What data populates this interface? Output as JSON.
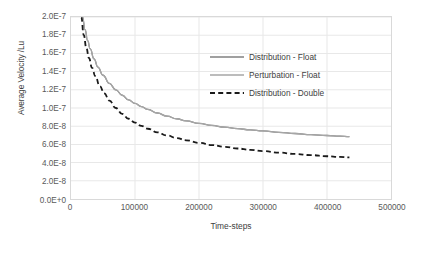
{
  "chart_data": {
    "type": "line",
    "title": "",
    "xlabel": "Time-steps",
    "ylabel": "Average Velocity /Lu",
    "xlim": [
      0,
      500000
    ],
    "ylim": [
      0,
      2e-07
    ],
    "grid": true,
    "legend_position": "inside-upper-right",
    "x_ticks": [
      0,
      100000,
      200000,
      300000,
      400000,
      500000
    ],
    "x_tick_labels": [
      "0",
      "100000",
      "200000",
      "300000",
      "400000",
      "500000"
    ],
    "y_ticks": [
      0,
      2e-08,
      4e-08,
      6e-08,
      8e-08,
      1e-07,
      1.2e-07,
      1.4e-07,
      1.6e-07,
      1.8e-07,
      2e-07
    ],
    "y_tick_labels": [
      "0.0E+0",
      "2.0E-8",
      "4.0E-8",
      "6.0E-8",
      "8.0E-8",
      "1.0E-7",
      "1.2E-7",
      "1.4E-7",
      "1.6E-7",
      "1.8E-7",
      "2.0E-7"
    ],
    "series": [
      {
        "name": "Distribution - Float",
        "style": "solid",
        "color": "#808080",
        "width": 1.3,
        "x": [
          18000,
          22000,
          26000,
          30000,
          36000,
          42000,
          50000,
          60000,
          70000,
          80000,
          90000,
          100000,
          110000,
          120000,
          135000,
          150000,
          165000,
          180000,
          200000,
          220000,
          240000,
          260000,
          280000,
          300000,
          325000,
          350000,
          375000,
          400000,
          420000,
          435000
        ],
        "y": [
          2e-07,
          1.86e-07,
          1.74e-07,
          1.65e-07,
          1.54e-07,
          1.45e-07,
          1.36e-07,
          1.27e-07,
          1.2e-07,
          1.14e-07,
          1.09e-07,
          1.05e-07,
          1.015e-07,
          9.85e-08,
          9.45e-08,
          9.1e-08,
          8.82e-08,
          8.58e-08,
          8.3e-08,
          8.08e-08,
          7.9e-08,
          7.73e-08,
          7.6e-08,
          7.48e-08,
          7.33e-08,
          7.2e-08,
          7.08e-08,
          6.98e-08,
          6.9e-08,
          6.85e-08
        ]
      },
      {
        "name": "Perturbation - Float",
        "style": "solid",
        "color": "#a6a6a6",
        "width": 1.3,
        "x": [
          18000,
          22000,
          26000,
          30000,
          36000,
          42000,
          50000,
          60000,
          70000,
          80000,
          90000,
          100000,
          110000,
          120000,
          135000,
          150000,
          165000,
          180000,
          200000,
          220000,
          240000,
          260000,
          280000,
          300000,
          325000,
          350000,
          375000,
          400000,
          420000,
          435000
        ],
        "y": [
          2e-07,
          1.86e-07,
          1.74e-07,
          1.65e-07,
          1.54e-07,
          1.45e-07,
          1.36e-07,
          1.27e-07,
          1.2e-07,
          1.14e-07,
          1.09e-07,
          1.05e-07,
          1.015e-07,
          9.85e-08,
          9.45e-08,
          9.1e-08,
          8.82e-08,
          8.58e-08,
          8.3e-08,
          8.08e-08,
          7.9e-08,
          7.73e-08,
          7.6e-08,
          7.48e-08,
          7.33e-08,
          7.2e-08,
          7.08e-08,
          6.98e-08,
          6.9e-08,
          6.85e-08
        ]
      },
      {
        "name": "Distribution - Double",
        "style": "dashed",
        "color": "#1a1a1a",
        "width": 1.8,
        "x": [
          16000,
          20000,
          24000,
          28000,
          33000,
          38000,
          45000,
          52000,
          60000,
          70000,
          80000,
          90000,
          100000,
          110000,
          120000,
          135000,
          150000,
          165000,
          180000,
          200000,
          220000,
          240000,
          260000,
          280000,
          300000,
          325000,
          350000,
          375000,
          400000,
          420000,
          435000
        ],
        "y": [
          2e-07,
          1.8e-07,
          1.66e-07,
          1.55e-07,
          1.44e-07,
          1.35e-07,
          1.24e-07,
          1.16e-07,
          1.08e-07,
          1e-07,
          9.35e-08,
          8.82e-08,
          8.4e-08,
          8.03e-08,
          7.72e-08,
          7.32e-08,
          6.98e-08,
          6.7e-08,
          6.45e-08,
          6.17e-08,
          5.93e-08,
          5.73e-08,
          5.55e-08,
          5.4e-08,
          5.27e-08,
          5.1e-08,
          4.95e-08,
          4.82e-08,
          4.7e-08,
          4.62e-08,
          4.57e-08
        ]
      }
    ]
  },
  "axes": {
    "y_title": "Average Velocity /Lu",
    "x_title": "Time-steps"
  },
  "legend": {
    "items": [
      {
        "label": "Distribution - Float"
      },
      {
        "label": "Perturbation - Float"
      },
      {
        "label": "Distribution - Double"
      }
    ]
  },
  "colors": {
    "series_1": "#808080",
    "series_2": "#a6a6a6",
    "series_3": "#1a1a1a",
    "grid": "#e8e8e8",
    "axis_border": "#d9d9d9",
    "text": "#595959"
  }
}
